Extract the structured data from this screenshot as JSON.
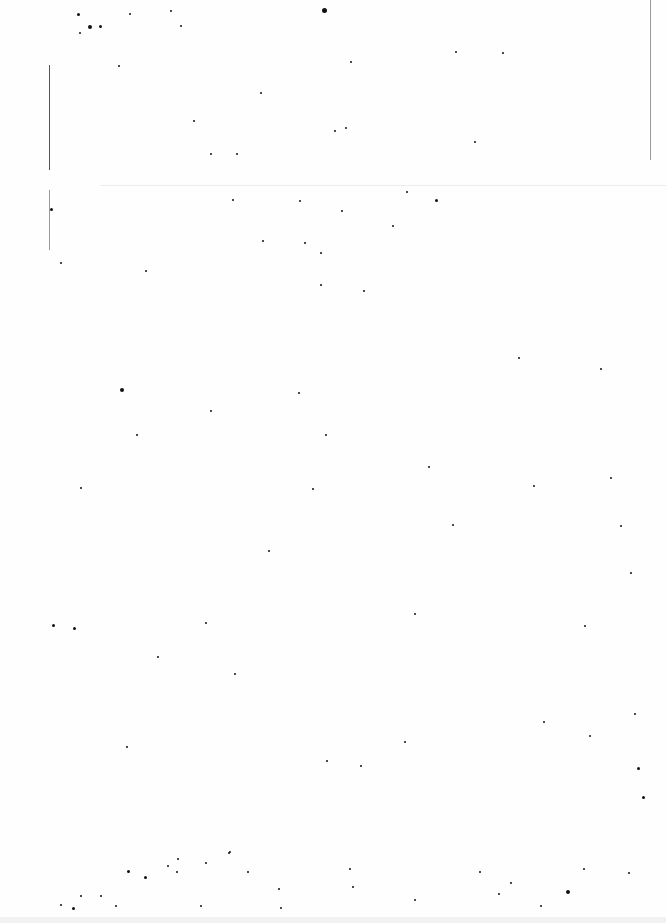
{
  "document": {
    "type": "blank-scanned-page",
    "text_content": "",
    "background_color": "#ffffff",
    "noise_color": "#111111"
  },
  "speckles": [
    [
      77,
      13,
      3
    ],
    [
      88,
      25,
      4
    ],
    [
      99,
      25,
      3
    ],
    [
      79,
      32,
      2
    ],
    [
      170,
      10,
      2
    ],
    [
      180,
      25,
      2
    ],
    [
      129,
      13,
      2
    ],
    [
      322,
      8,
      5
    ],
    [
      118,
      65,
      2
    ],
    [
      193,
      120,
      2
    ],
    [
      260,
      92,
      2
    ],
    [
      350,
      61,
      2
    ],
    [
      334,
      130,
      2
    ],
    [
      345,
      127,
      2
    ],
    [
      455,
      51,
      2
    ],
    [
      502,
      52,
      2
    ],
    [
      210,
      153,
      2
    ],
    [
      236,
      153,
      2
    ],
    [
      474,
      141,
      2
    ],
    [
      406,
      191,
      2
    ],
    [
      435,
      199,
      3
    ],
    [
      232,
      199,
      2
    ],
    [
      50,
      208,
      3
    ],
    [
      299,
      200,
      2
    ],
    [
      341,
      210,
      2
    ],
    [
      262,
      240,
      2
    ],
    [
      304,
      242,
      2
    ],
    [
      320,
      252,
      2
    ],
    [
      60,
      262,
      2
    ],
    [
      392,
      225,
      2
    ],
    [
      145,
      270,
      2
    ],
    [
      363,
      290,
      2
    ],
    [
      320,
      284,
      2
    ],
    [
      120,
      388,
      4
    ],
    [
      518,
      357,
      2
    ],
    [
      600,
      368,
      2
    ],
    [
      210,
      410,
      2
    ],
    [
      136,
      434,
      2
    ],
    [
      325,
      434,
      2
    ],
    [
      298,
      392,
      2
    ],
    [
      80,
      487,
      2
    ],
    [
      428,
      466,
      2
    ],
    [
      533,
      485,
      2
    ],
    [
      312,
      488,
      2
    ],
    [
      610,
      477,
      2
    ],
    [
      268,
      550,
      2
    ],
    [
      452,
      524,
      2
    ],
    [
      620,
      525,
      2
    ],
    [
      630,
      572,
      2
    ],
    [
      52,
      624,
      3
    ],
    [
      73,
      627,
      3
    ],
    [
      205,
      622,
      2
    ],
    [
      414,
      613,
      2
    ],
    [
      584,
      625,
      2
    ],
    [
      157,
      656,
      2
    ],
    [
      234,
      673,
      2
    ],
    [
      634,
      713,
      2
    ],
    [
      126,
      746,
      2
    ],
    [
      326,
      760,
      2
    ],
    [
      404,
      741,
      2
    ],
    [
      543,
      721,
      2
    ],
    [
      637,
      767,
      3
    ],
    [
      642,
      796,
      3
    ],
    [
      360,
      765,
      2
    ],
    [
      589,
      735,
      2
    ],
    [
      229,
      851,
      2
    ],
    [
      177,
      858,
      2
    ],
    [
      127,
      870,
      3
    ],
    [
      80,
      895,
      2
    ],
    [
      72,
      907,
      3
    ],
    [
      100,
      895,
      2
    ],
    [
      176,
      871,
      2
    ],
    [
      167,
      865,
      2
    ],
    [
      144,
      876,
      3
    ],
    [
      205,
      862,
      2
    ],
    [
      228,
      852,
      2
    ],
    [
      247,
      871,
      2
    ],
    [
      278,
      888,
      2
    ],
    [
      349,
      868,
      2
    ],
    [
      352,
      886,
      2
    ],
    [
      414,
      899,
      2
    ],
    [
      479,
      871,
      2
    ],
    [
      498,
      893,
      2
    ],
    [
      510,
      882,
      2
    ],
    [
      540,
      905,
      2
    ],
    [
      583,
      868,
      2
    ],
    [
      566,
      890,
      4
    ],
    [
      628,
      872,
      2
    ],
    [
      60,
      904,
      2
    ],
    [
      115,
      905,
      2
    ],
    [
      200,
      905,
      2
    ],
    [
      280,
      907,
      2
    ]
  ]
}
